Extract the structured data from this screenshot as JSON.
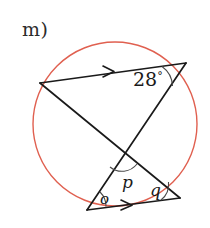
{
  "figure": {
    "part_label": "m)",
    "shape": "circle-with-two-intersecting-chords",
    "circle": {
      "color": "#e06050",
      "cx": 115,
      "cy": 124,
      "r": 82,
      "stroke_width": 1.4
    },
    "line_color": "#1a1a1a",
    "line_width": 1.6,
    "points": {
      "left_vertex": {
        "x": 40,
        "y": 83
      },
      "top_right_vertex": {
        "x": 186,
        "y": 63
      },
      "bottom_left_vertex": {
        "x": 87,
        "y": 210
      },
      "bottom_right_vertex": {
        "x": 180,
        "y": 198
      },
      "crossing_point": {
        "x": 122,
        "y": 152
      }
    },
    "segments": [
      {
        "name": "top-chord",
        "from": "left_vertex",
        "to": "top_right_vertex",
        "marker": "single-arrow"
      },
      {
        "name": "bottom-chord",
        "from": "bottom_left_vertex",
        "to": "bottom_right_vertex",
        "marker": "single-arrow"
      },
      {
        "name": "chord-left-to-bottom-right",
        "from": "left_vertex",
        "to": "bottom_right_vertex",
        "marker": "none"
      },
      {
        "name": "chord-top-right-to-bottom-left",
        "from": "top_right_vertex",
        "to": "bottom_left_vertex",
        "marker": "none"
      }
    ],
    "parallel_marks": {
      "top_arrow": {
        "x": 110,
        "y": 71
      },
      "bottom_arrow": {
        "x": 128,
        "y": 205
      }
    },
    "angles": {
      "known": {
        "label": "28",
        "degree_symbol": "°",
        "value": 28,
        "at": "top_right_vertex"
      },
      "unknown": [
        {
          "label": "o",
          "at": "bottom_left_vertex"
        },
        {
          "label": "p",
          "at": "crossing_point"
        },
        {
          "label": "q",
          "at": "bottom_right_vertex"
        }
      ]
    }
  }
}
